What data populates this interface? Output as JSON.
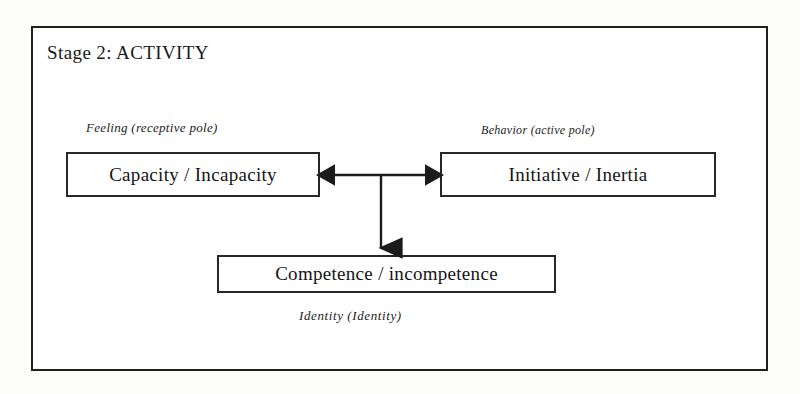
{
  "diagram": {
    "title": "Stage 2: ACTIVITY",
    "frame": {
      "border_color": "#1f1f1f",
      "background": "#ffffff"
    },
    "captions": {
      "left_pole": "Feeling (receptive pole)",
      "right_pole": "Behavior (active pole)",
      "bottom": "Identity  (Identity)"
    },
    "boxes": [
      {
        "id": "feeling",
        "label": "Capacity / Incapacity",
        "position": "left"
      },
      {
        "id": "behavior",
        "label": "Initiative / Inertia",
        "position": "right"
      },
      {
        "id": "identity",
        "label": "Competence / incompetence",
        "position": "bottom-center"
      }
    ],
    "connectors": [
      {
        "id": "horizontal-bidirectional",
        "name": "double-headed-horizontal-arrow",
        "from": "feeling",
        "to": "behavior",
        "style": "bidirectional"
      },
      {
        "id": "vertical-down",
        "name": "down-arrow",
        "from": "midpoint",
        "to": "identity",
        "style": "unidirectional"
      }
    ],
    "colors": {
      "ink": "#1a1a1a",
      "box_border": "#272727",
      "page": "#fdfdfc"
    }
  }
}
